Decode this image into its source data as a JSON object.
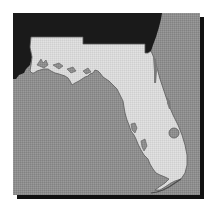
{
  "map": {
    "subject": "Florida",
    "style": "grayscale halftone",
    "colors": {
      "water": "#8e8e8e",
      "florida_land": "#d9d9d9",
      "neighbor_land": "#1a1a1a",
      "lake": "#8e8e8e",
      "coast_outline": "#5a5a5a",
      "shadow": "#111111"
    },
    "features": [
      {
        "name": "florida",
        "type": "land"
      },
      {
        "name": "georgia-alabama",
        "type": "neighbor-land"
      },
      {
        "name": "gulf-of-mexico",
        "type": "water"
      },
      {
        "name": "atlantic-ocean",
        "type": "water"
      },
      {
        "name": "lake-okeechobee",
        "type": "lake"
      }
    ]
  }
}
